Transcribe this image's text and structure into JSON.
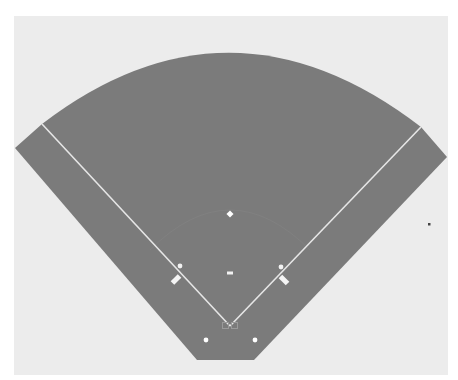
{
  "figure": {
    "type": "baseball-field-diagram",
    "caption_cropped": "",
    "colors": {
      "page_background": "#ffffff",
      "panel_background": "#ececec",
      "field_fill": "#7b7b7b",
      "line_color": "#e6e6e6",
      "marker_color": "#ffffff",
      "stray_dot": "#444444"
    },
    "elements": {
      "outfield_fence": "arc",
      "foul_lines": [
        "left-field-line",
        "right-field-line"
      ],
      "bases": [
        "home-plate",
        "first-base",
        "second-base",
        "third-base"
      ],
      "pitchers_mound": "pitching-rubber",
      "coach_boxes": [
        "first-base-coach-box",
        "third-base-coach-box"
      ],
      "on_deck_circles": [
        "left-on-deck-circle",
        "right-on-deck-circle"
      ]
    }
  }
}
